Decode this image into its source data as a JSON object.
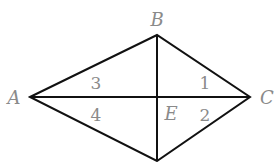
{
  "diagram": {
    "type": "kite-quadrilateral",
    "stroke_color": "#111111",
    "label_color": "#8a8a8a",
    "vertices": [
      {
        "name": "A",
        "x": 30,
        "y": 97,
        "label_x": 14,
        "label_y": 104
      },
      {
        "name": "B",
        "x": 157,
        "y": 35,
        "label_x": 157,
        "label_y": 26
      },
      {
        "name": "C",
        "x": 250,
        "y": 97,
        "label_x": 267,
        "label_y": 104
      },
      {
        "name": "D",
        "x": 157,
        "y": 161
      },
      {
        "name": "E",
        "x": 157,
        "y": 97,
        "label_x": 171,
        "label_y": 120
      }
    ],
    "angle_labels": [
      {
        "text": "3",
        "x": 96,
        "y": 89
      },
      {
        "text": "4",
        "x": 96,
        "y": 121
      },
      {
        "text": "1",
        "x": 205,
        "y": 89
      },
      {
        "text": "2",
        "x": 205,
        "y": 121
      }
    ],
    "labels": {
      "A": "A",
      "B": "B",
      "C": "C",
      "E": "E",
      "angle1": "1",
      "angle2": "2",
      "angle3": "3",
      "angle4": "4"
    }
  }
}
